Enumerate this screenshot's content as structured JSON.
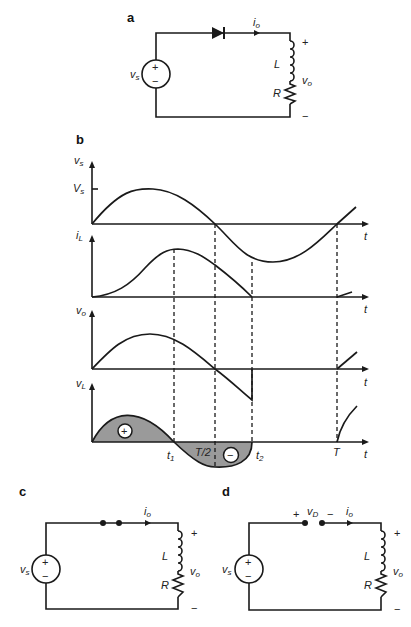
{
  "panels": {
    "a": {
      "label": "a",
      "source": {
        "name": "v",
        "sub": "s",
        "plus": "+",
        "minus": "−"
      },
      "current": {
        "name": "i",
        "sub": "o"
      },
      "inductor": "L",
      "resistor": "R",
      "output": {
        "name": "v",
        "sub": "o",
        "plus": "+",
        "minus": "−"
      },
      "switch_element": "diode"
    },
    "b": {
      "label": "b",
      "waveforms": [
        {
          "ylabel": "v",
          "ysub": "s",
          "tick_label": "V",
          "tick_sub": "s",
          "xlabel": "t"
        },
        {
          "ylabel": "i",
          "ysub": "L",
          "xlabel": "t"
        },
        {
          "ylabel": "v",
          "ysub": "o",
          "xlabel": "t"
        },
        {
          "ylabel": "v",
          "ysub": "L",
          "xlabel": "t"
        }
      ],
      "markers": {
        "t1": {
          "name": "t",
          "sub": "1"
        },
        "half": "T/2",
        "t2": {
          "name": "t",
          "sub": "2"
        },
        "T": "T"
      },
      "area_signs": {
        "positive": "+",
        "negative": "−"
      },
      "fill_color": "#9a9a9a"
    },
    "c": {
      "label": "c",
      "source": {
        "name": "v",
        "sub": "s",
        "plus": "+",
        "minus": "−"
      },
      "current": {
        "name": "i",
        "sub": "o"
      },
      "inductor": "L",
      "resistor": "R",
      "output": {
        "name": "v",
        "sub": "o",
        "plus": "+",
        "minus": "−"
      },
      "switch_element": "closed switch (short)"
    },
    "d": {
      "label": "d",
      "source": {
        "name": "v",
        "sub": "s",
        "plus": "+",
        "minus": "−"
      },
      "current": {
        "name": "i",
        "sub": "o"
      },
      "inductor": "L",
      "resistor": "R",
      "output": {
        "name": "v",
        "sub": "o",
        "plus": "+",
        "minus": "−"
      },
      "diode_voltage": {
        "name": "v",
        "sub": "D",
        "plus": "+",
        "minus": "−"
      },
      "switch_element": "open switch"
    }
  }
}
